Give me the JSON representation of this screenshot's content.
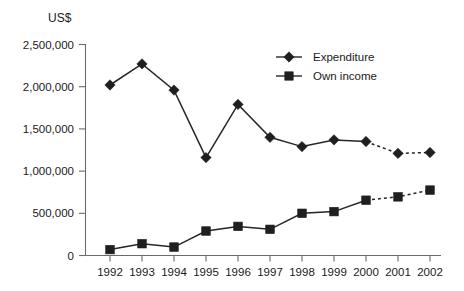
{
  "chart_data": {
    "type": "line",
    "title": "",
    "xlabel": "",
    "ylabel": "US$",
    "categories": [
      "1992",
      "1993",
      "1994",
      "1995",
      "1996",
      "1997",
      "1998",
      "1999",
      "2000",
      "2001",
      "2002"
    ],
    "ylim": [
      0,
      2500000
    ],
    "ytick_labels": [
      "2,500,000",
      "2,000,000",
      "1,500,000",
      "1,000,000",
      "500,000",
      "0"
    ],
    "ytick_values": [
      2500000,
      2000000,
      1500000,
      1000000,
      500000,
      0
    ],
    "grid": false,
    "legend_position": "top-right",
    "series": [
      {
        "name": "Expenditure",
        "marker": "diamond",
        "values": [
          2020000,
          2270000,
          1960000,
          1160000,
          1790000,
          1400000,
          1290000,
          1370000,
          1350000,
          1210000,
          1220000
        ],
        "projected_from": "2000"
      },
      {
        "name": "Own income",
        "marker": "square",
        "values": [
          70000,
          140000,
          100000,
          290000,
          345000,
          310000,
          500000,
          520000,
          655000,
          695000,
          775000
        ],
        "projected_from": "2000"
      }
    ]
  },
  "legend": {
    "items": [
      {
        "label": "Expenditure",
        "marker": "diamond"
      },
      {
        "label": "Own income",
        "marker": "square"
      }
    ]
  },
  "axis": {
    "y_unit_label": "US$"
  }
}
